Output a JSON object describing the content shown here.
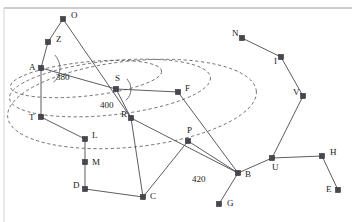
{
  "diagram": {
    "colors": {
      "node": "#46464e",
      "edge": "#4a4a52",
      "ellipse": "#55555c",
      "background": "#ffffff",
      "frame": "#9a9a9a"
    },
    "nodes": [
      {
        "id": "O",
        "label": "O",
        "x": 63,
        "y": 19,
        "lx": 71,
        "ly": 18
      },
      {
        "id": "Z",
        "label": "Z",
        "x": 48,
        "y": 42,
        "lx": 56,
        "ly": 42
      },
      {
        "id": "A",
        "label": "A",
        "x": 41,
        "y": 68,
        "lx": 29,
        "ly": 70
      },
      {
        "id": "T",
        "label": "T",
        "x": 41,
        "y": 117,
        "lx": 29,
        "ly": 120
      },
      {
        "id": "S",
        "label": "S",
        "x": 116,
        "y": 89,
        "lx": 115,
        "ly": 81
      },
      {
        "id": "F",
        "label": "F",
        "x": 178,
        "y": 92,
        "lx": 185,
        "ly": 91
      },
      {
        "id": "R",
        "label": "R",
        "x": 131,
        "y": 118,
        "lx": 121,
        "ly": 117
      },
      {
        "id": "L",
        "label": "L",
        "x": 85,
        "y": 139,
        "lx": 92,
        "ly": 138
      },
      {
        "id": "M",
        "label": "M",
        "x": 85,
        "y": 162,
        "lx": 92,
        "ly": 165
      },
      {
        "id": "D",
        "label": "D",
        "x": 85,
        "y": 189,
        "lx": 73,
        "ly": 188
      },
      {
        "id": "C",
        "label": "C",
        "x": 143,
        "y": 197,
        "lx": 150,
        "ly": 199
      },
      {
        "id": "P",
        "label": "P",
        "x": 188,
        "y": 141,
        "lx": 187,
        "ly": 133
      },
      {
        "id": "B",
        "label": "B",
        "x": 238,
        "y": 173,
        "lx": 245,
        "ly": 177
      },
      {
        "id": "G",
        "label": "G",
        "x": 219,
        "y": 204,
        "lx": 227,
        "ly": 206
      },
      {
        "id": "U",
        "label": "U",
        "x": 272,
        "y": 158,
        "lx": 272,
        "ly": 170
      },
      {
        "id": "H",
        "label": "H",
        "x": 322,
        "y": 156,
        "lx": 330,
        "ly": 155
      },
      {
        "id": "E",
        "label": "E",
        "x": 338,
        "y": 190,
        "lx": 326,
        "ly": 192
      },
      {
        "id": "V",
        "label": "V",
        "x": 303,
        "y": 96,
        "lx": 293,
        "ly": 95
      },
      {
        "id": "I",
        "label": "I",
        "x": 281,
        "y": 57,
        "lx": 274,
        "ly": 64
      },
      {
        "id": "N",
        "label": "N",
        "x": 242,
        "y": 38,
        "lx": 232,
        "ly": 36
      }
    ],
    "edges": [
      {
        "from": "O",
        "to": "Z"
      },
      {
        "from": "O",
        "to": "R"
      },
      {
        "from": "Z",
        "to": "A"
      },
      {
        "from": "A",
        "to": "T"
      },
      {
        "from": "A",
        "to": "S"
      },
      {
        "from": "S",
        "to": "F"
      },
      {
        "from": "S",
        "to": "R"
      },
      {
        "from": "F",
        "to": "B"
      },
      {
        "from": "R",
        "to": "C"
      },
      {
        "from": "R",
        "to": "B"
      },
      {
        "from": "T",
        "to": "L"
      },
      {
        "from": "L",
        "to": "M"
      },
      {
        "from": "M",
        "to": "D"
      },
      {
        "from": "D",
        "to": "C"
      },
      {
        "from": "C",
        "to": "P"
      },
      {
        "from": "P",
        "to": "B"
      },
      {
        "from": "B",
        "to": "G"
      },
      {
        "from": "B",
        "to": "U"
      },
      {
        "from": "U",
        "to": "H"
      },
      {
        "from": "U",
        "to": "V"
      },
      {
        "from": "H",
        "to": "E"
      },
      {
        "from": "V",
        "to": "I"
      },
      {
        "from": "I",
        "to": "N"
      }
    ],
    "edge_labels": [
      {
        "text": "380",
        "x": 56,
        "y": 80
      },
      {
        "text": "400",
        "x": 100,
        "y": 108
      },
      {
        "text": "420",
        "x": 192,
        "y": 182
      }
    ],
    "ellipses": [
      {
        "name": "ellipse-380",
        "cx": 86,
        "cy": 79,
        "rx": 76,
        "ry": 17,
        "rotate": -6
      },
      {
        "name": "ellipse-400",
        "cx": 110,
        "cy": 88,
        "rx": 101,
        "ry": 27,
        "rotate": -6
      },
      {
        "name": "ellipse-420",
        "cx": 132,
        "cy": 104,
        "rx": 125,
        "ry": 43,
        "rotate": -6
      }
    ],
    "angle_arcs": [
      {
        "name": "arc-at-a",
        "cx": 41,
        "cy": 68,
        "r": 19
      },
      {
        "name": "arc-at-s",
        "cx": 116,
        "cy": 89,
        "r": 15
      }
    ]
  }
}
